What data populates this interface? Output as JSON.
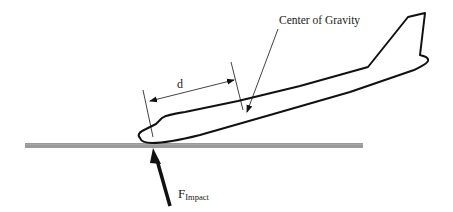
{
  "diagram": {
    "labels": {
      "center_of_gravity": "Center of Gravity",
      "distance": "d",
      "force_main": "F",
      "force_sub": "Impact"
    },
    "elements": [
      {
        "id": "ground",
        "type": "bar",
        "desc": "gray ground/runway surface"
      },
      {
        "id": "aircraft",
        "type": "outline",
        "desc": "aircraft fuselage and tail outline, nose touching ground"
      },
      {
        "id": "dimension-d",
        "type": "dimension",
        "desc": "distance d between nose impact point and center of gravity"
      },
      {
        "id": "cg-leader",
        "type": "arrow",
        "desc": "leader arrow pointing to center of gravity"
      },
      {
        "id": "impact-arrow",
        "type": "arrow",
        "desc": "impact force arrow pushing up on nose"
      }
    ],
    "colors": {
      "line": "#111111",
      "ground": "#9a9a9a",
      "background": "#ffffff"
    }
  }
}
